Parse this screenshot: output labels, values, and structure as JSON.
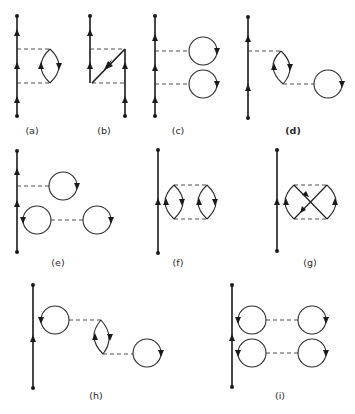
{
  "figure": {
    "panels": [
      {
        "id": "a",
        "label": "(a)"
      },
      {
        "id": "b",
        "label": "(b)"
      },
      {
        "id": "c",
        "label": "(c)"
      },
      {
        "id": "d",
        "label": "(d)"
      },
      {
        "id": "e",
        "label": "(e)"
      },
      {
        "id": "f",
        "label": "(f)"
      },
      {
        "id": "g",
        "label": "(g)"
      },
      {
        "id": "h",
        "label": "(h)"
      },
      {
        "id": "i",
        "label": "(i)"
      }
    ]
  },
  "colors": {
    "line": "#1a1a1a",
    "dashed": "#3a3a3a",
    "background": "#ffffff"
  }
}
